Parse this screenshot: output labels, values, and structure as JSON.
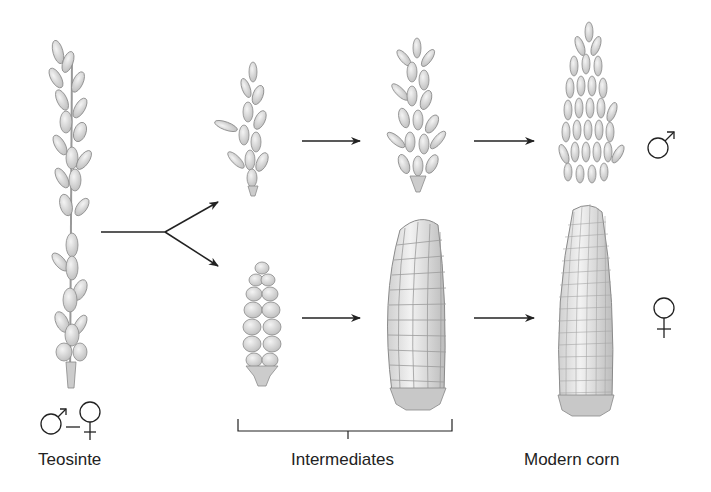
{
  "labels": {
    "teosinte": "Teosinte",
    "intermediates": "Intermediates",
    "modern_corn": "Modern corn"
  },
  "symbols": {
    "teosinte_sex": "male-female",
    "top_row_sex": "male",
    "bottom_row_sex": "female"
  },
  "stages": [
    {
      "name": "teosinte",
      "structure": "mixed spike"
    },
    {
      "name": "intermediate-1",
      "top": "small tassel",
      "bottom": "small ear"
    },
    {
      "name": "intermediate-2",
      "top": "tassel",
      "bottom": "large ear"
    },
    {
      "name": "modern-corn",
      "top": "male tassel",
      "bottom": "corn cob"
    }
  ],
  "colors": {
    "line": "#222222",
    "plant_fill": "#d8d8d8",
    "plant_stroke": "#8a8a8a",
    "background": "#ffffff"
  }
}
